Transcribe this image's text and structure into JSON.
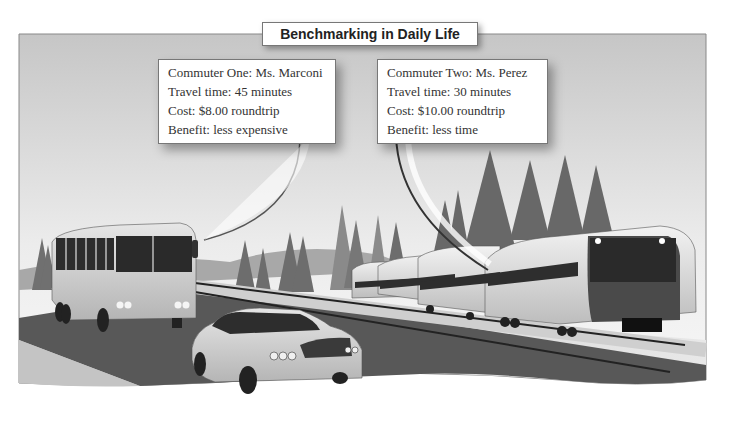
{
  "title": "Benchmarking in Daily Life",
  "callouts": [
    {
      "commuter": "Commuter One: Ms. Marconi",
      "travel_time": "Travel time: 45 minutes",
      "cost": "Cost: $8.00 roundtrip",
      "benefit": "Benefit: less expensive",
      "points_to": "bus"
    },
    {
      "commuter": "Commuter Two: Ms. Perez",
      "travel_time": "Travel time: 30 minutes",
      "cost": "Cost: $10.00 roundtrip",
      "benefit": "Benefit: less time",
      "points_to": "train"
    }
  ],
  "scene": {
    "elements": [
      "bus",
      "car",
      "train",
      "trees",
      "road",
      "railway"
    ],
    "colors": {
      "sky_top": "#c9c9c9",
      "sky_bottom": "#f2f2f2",
      "road": "#5a5a5a",
      "trees": "#6e6e6e",
      "vehicle_body": "#d8d8d8",
      "window": "#3a3a3a"
    }
  }
}
